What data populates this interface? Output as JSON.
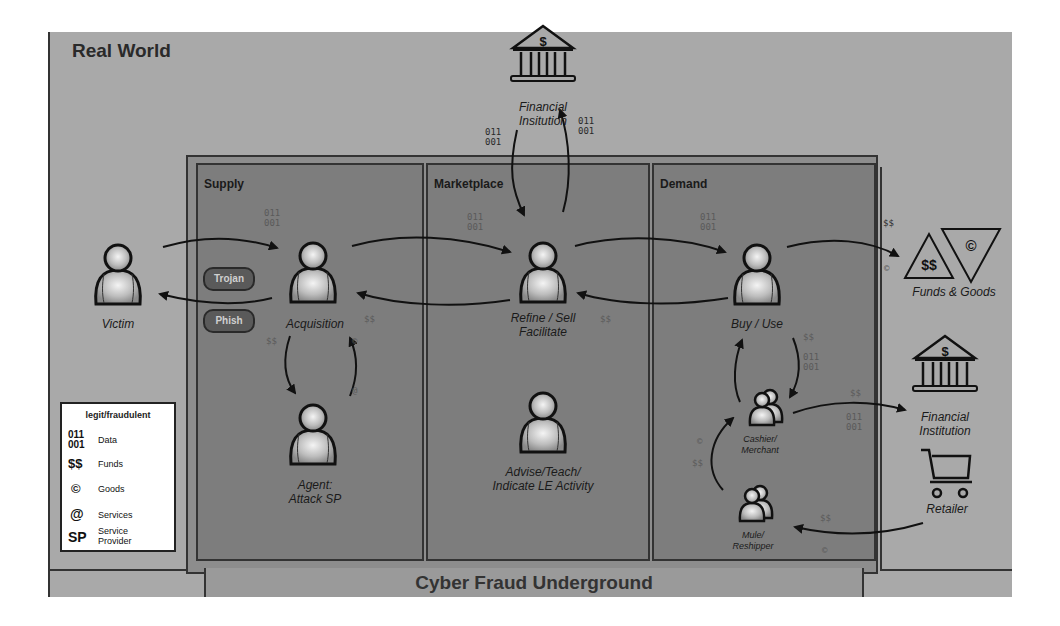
{
  "regions": {
    "real_world": "Real World",
    "underground": "Cyber Fraud Underground",
    "supply": "Supply",
    "marketplace": "Marketplace",
    "demand": "Demand"
  },
  "actors": {
    "victim": "Victim",
    "acquisition": "Acquisition",
    "agent_line1": "Agent:",
    "agent_line2": "Attack SP",
    "refine_line1": "Refine / Sell",
    "refine_line2": "Facilitate",
    "advise_line1": "Advise/Teach/",
    "advise_line2": "Indicate LE Activity",
    "buy_use": "Buy / Use",
    "cashier_line1": "Cashier/",
    "cashier_line2": "Merchant",
    "mule_line1": "Mule/",
    "mule_line2": "Reshipper"
  },
  "methods": {
    "trojan": "Trojan",
    "phish": "Phish"
  },
  "entities": {
    "financial_top_line1": "Financial",
    "financial_top_line2": "Insitution",
    "financial_right_line1": "Financial",
    "financial_right_line2": "Institution",
    "retailer": "Retailer",
    "funds_goods": "Funds & Goods",
    "funds_symbol": "$$",
    "goods_symbol": "©",
    "bank_symbol": "$"
  },
  "tokens": {
    "data": "011\n001",
    "data_line1": "011",
    "data_line2": "001",
    "funds": "$$",
    "goods": "©",
    "services": "@"
  },
  "legend": {
    "title": "legit/fraudulent",
    "items": [
      {
        "symbol": "011\n001",
        "symbol_line1": "011",
        "symbol_line2": "001",
        "label": "Data"
      },
      {
        "symbol": "$$",
        "label": "Funds"
      },
      {
        "symbol": "©",
        "label": "Goods"
      },
      {
        "symbol": "@",
        "label": "Services"
      },
      {
        "symbol": "SP",
        "label_line1": "Service",
        "label_line2": "Provider"
      }
    ]
  },
  "colors": {
    "real_world_bg": "#a9a9a9",
    "underground_bg": "#7d7d7d",
    "pill_bg": "#5a5a5a",
    "line": "#1a1a1a"
  }
}
